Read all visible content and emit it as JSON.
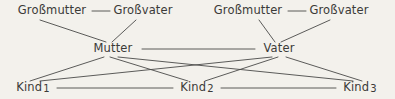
{
  "diagram": {
    "background_color": "#f3f1ec",
    "text_color": "#3b3a38",
    "line_color": "#4a4a48",
    "generations": [
      {
        "name": "grandparents",
        "nodes": [
          {
            "id": "gm1",
            "label": "Großmutter",
            "x": 52,
            "y": 11
          },
          {
            "id": "gv1",
            "label": "Großvater",
            "x": 143,
            "y": 11
          },
          {
            "id": "gm2",
            "label": "Großmutter",
            "x": 248,
            "y": 11
          },
          {
            "id": "gv2",
            "label": "Großvater",
            "x": 339,
            "y": 11
          }
        ]
      },
      {
        "name": "parents",
        "nodes": [
          {
            "id": "mutter",
            "label": "Mutter",
            "x": 113,
            "y": 49
          },
          {
            "id": "vater",
            "label": "Vater",
            "x": 279,
            "y": 49
          }
        ]
      },
      {
        "name": "children",
        "nodes": [
          {
            "id": "kind1",
            "label": "Kind",
            "number": "1",
            "x": 33,
            "y": 88
          },
          {
            "id": "kind2",
            "label": "Kind",
            "number": "2",
            "x": 197,
            "y": 88
          },
          {
            "id": "kind3",
            "label": "Kind",
            "number": "3",
            "x": 360,
            "y": 88
          }
        ]
      }
    ],
    "edges": [
      {
        "id": "marriage-gp1",
        "type": "marriage",
        "from": "gm1",
        "to": "gv1",
        "x1": 92,
        "y1": 11,
        "x2": 112,
        "y2": 11
      },
      {
        "id": "marriage-gp2",
        "type": "marriage",
        "from": "gm2",
        "to": "gv2",
        "x1": 288,
        "y1": 11,
        "x2": 308,
        "y2": 11
      },
      {
        "id": "marriage-parents",
        "type": "marriage",
        "from": "mutter",
        "to": "vater",
        "x1": 142,
        "y1": 49,
        "x2": 255,
        "y2": 49
      },
      {
        "id": "marriage-k1-k2",
        "type": "marriage",
        "from": "kind1",
        "to": "kind2",
        "x1": 57,
        "y1": 88,
        "x2": 173,
        "y2": 88
      },
      {
        "id": "marriage-k2-k3",
        "type": "marriage",
        "from": "kind2",
        "to": "kind3",
        "x1": 221,
        "y1": 88,
        "x2": 336,
        "y2": 88
      },
      {
        "id": "gm1-mutter",
        "type": "descent",
        "from": "gm1",
        "to": "mutter",
        "x1": 40,
        "y1": 20,
        "x2": 106,
        "y2": 42
      },
      {
        "id": "gv1-mutter",
        "type": "descent",
        "from": "gv1",
        "to": "mutter",
        "x1": 136,
        "y1": 20,
        "x2": 112,
        "y2": 42
      },
      {
        "id": "gm2-vater",
        "type": "descent",
        "from": "gm2",
        "to": "vater",
        "x1": 259,
        "y1": 20,
        "x2": 275,
        "y2": 42
      },
      {
        "id": "gv2-vater",
        "type": "descent",
        "from": "gv2",
        "to": "vater",
        "x1": 330,
        "y1": 20,
        "x2": 281,
        "y2": 42
      },
      {
        "id": "mutter-kind1",
        "type": "descent",
        "from": "mutter",
        "to": "kind1",
        "x1": 104,
        "y1": 57,
        "x2": 30,
        "y2": 81
      },
      {
        "id": "mutter-kind2",
        "type": "descent",
        "from": "mutter",
        "to": "kind2",
        "x1": 110,
        "y1": 57,
        "x2": 188,
        "y2": 81
      },
      {
        "id": "mutter-kind3",
        "type": "descent",
        "from": "mutter",
        "to": "kind3",
        "x1": 118,
        "y1": 57,
        "x2": 353,
        "y2": 81
      },
      {
        "id": "vater-kind1",
        "type": "descent",
        "from": "vater",
        "to": "kind1",
        "x1": 272,
        "y1": 57,
        "x2": 40,
        "y2": 81
      },
      {
        "id": "vater-kind2",
        "type": "descent",
        "from": "vater",
        "to": "kind2",
        "x1": 278,
        "y1": 57,
        "x2": 205,
        "y2": 81
      },
      {
        "id": "vater-kind3",
        "type": "descent",
        "from": "vater",
        "to": "kind3",
        "x1": 286,
        "y1": 57,
        "x2": 362,
        "y2": 81
      }
    ]
  }
}
